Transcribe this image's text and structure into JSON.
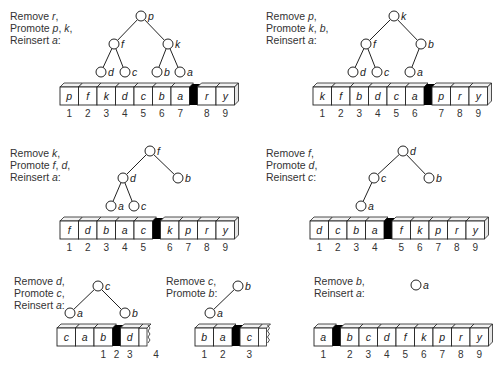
{
  "panels": [
    {
      "id": "step1",
      "caption": [
        [
          "Remove ",
          "r",
          ","
        ],
        [
          "Promote ",
          "p",
          ", ",
          "k",
          ","
        ],
        [
          "Reinsert ",
          "a",
          ":"
        ]
      ],
      "caption_pos": [
        10,
        20
      ],
      "tree": {
        "nodes": [
          {
            "label": "p",
            "x": 141,
            "y": 16
          },
          {
            "label": "f",
            "x": 114,
            "y": 44
          },
          {
            "label": "k",
            "x": 168,
            "y": 44
          },
          {
            "label": "d",
            "x": 101,
            "y": 72
          },
          {
            "label": "c",
            "x": 125,
            "y": 72
          },
          {
            "label": "b",
            "x": 157,
            "y": 72
          },
          {
            "label": "a",
            "x": 180,
            "y": 72
          }
        ],
        "edges": [
          [
            0,
            1
          ],
          [
            0,
            2
          ],
          [
            1,
            3
          ],
          [
            1,
            4
          ],
          [
            2,
            5
          ],
          [
            2,
            6
          ]
        ]
      },
      "array": {
        "x": 60,
        "y": 87,
        "cells": [
          "p",
          "f",
          "k",
          "d",
          "c",
          "b",
          "a",
          "|",
          "r",
          "y"
        ],
        "indices": [
          "1",
          "2",
          "3",
          "4",
          "5",
          "6",
          "7",
          "",
          "8",
          "9"
        ],
        "torn": false
      }
    },
    {
      "id": "step2",
      "caption": [
        [
          "Remove ",
          "p",
          ","
        ],
        [
          "Promote ",
          "k",
          ", ",
          "b",
          ","
        ],
        [
          "Reinsert ",
          "a",
          ":"
        ]
      ],
      "caption_pos": [
        266,
        20
      ],
      "tree": {
        "nodes": [
          {
            "label": "k",
            "x": 394,
            "y": 16
          },
          {
            "label": "f",
            "x": 366,
            "y": 44
          },
          {
            "label": "b",
            "x": 421,
            "y": 44
          },
          {
            "label": "d",
            "x": 353,
            "y": 72
          },
          {
            "label": "c",
            "x": 377,
            "y": 72
          },
          {
            "label": "a",
            "x": 410,
            "y": 72
          }
        ],
        "edges": [
          [
            0,
            1
          ],
          [
            0,
            2
          ],
          [
            1,
            3
          ],
          [
            1,
            4
          ],
          [
            2,
            5
          ]
        ]
      },
      "array": {
        "x": 313,
        "y": 87,
        "cells": [
          "k",
          "f",
          "b",
          "d",
          "c",
          "a",
          "|",
          "p",
          "r",
          "y"
        ],
        "indices": [
          "1",
          "2",
          "3",
          "4",
          "5",
          "6",
          "",
          "7",
          "8",
          "9"
        ],
        "torn": false
      }
    },
    {
      "id": "step3",
      "caption": [
        [
          "Remove ",
          "k",
          ","
        ],
        [
          "Promote ",
          "f",
          ", ",
          "d",
          ","
        ],
        [
          "Reinsert ",
          "a",
          ":"
        ]
      ],
      "caption_pos": [
        10,
        157
      ],
      "tree": {
        "nodes": [
          {
            "label": "f",
            "x": 150,
            "y": 151
          },
          {
            "label": "d",
            "x": 123,
            "y": 178
          },
          {
            "label": "b",
            "x": 178,
            "y": 178
          },
          {
            "label": "a",
            "x": 111,
            "y": 206
          },
          {
            "label": "c",
            "x": 134,
            "y": 206
          }
        ],
        "edges": [
          [
            0,
            1
          ],
          [
            0,
            2
          ],
          [
            1,
            3
          ],
          [
            1,
            4
          ]
        ]
      },
      "array": {
        "x": 60,
        "y": 221,
        "cells": [
          "f",
          "d",
          "b",
          "a",
          "c",
          "|",
          "k",
          "p",
          "r",
          "y"
        ],
        "indices": [
          "1",
          "2",
          "3",
          "4",
          "5",
          "",
          "6",
          "7",
          "8",
          "9"
        ],
        "torn": false
      }
    },
    {
      "id": "step4",
      "caption": [
        [
          "Remove ",
          "f",
          ","
        ],
        [
          "Promote ",
          "d",
          ","
        ],
        [
          "Reinsert ",
          "c",
          ":"
        ]
      ],
      "caption_pos": [
        266,
        157
      ],
      "tree": {
        "nodes": [
          {
            "label": "d",
            "x": 403,
            "y": 151
          },
          {
            "label": "c",
            "x": 374,
            "y": 178
          },
          {
            "label": "b",
            "x": 429,
            "y": 178
          },
          {
            "label": "a",
            "x": 361,
            "y": 206
          }
        ],
        "edges": [
          [
            0,
            1
          ],
          [
            0,
            2
          ],
          [
            1,
            3
          ]
        ]
      },
      "array": {
        "x": 310,
        "y": 221,
        "cells": [
          "d",
          "c",
          "b",
          "a",
          "|",
          "f",
          "k",
          "p",
          "r",
          "y"
        ],
        "indices": [
          "1",
          "2",
          "3",
          "4",
          "",
          "5",
          "6",
          "7",
          "8",
          "9"
        ],
        "torn": false
      }
    },
    {
      "id": "step5",
      "caption": [
        [
          "Remove ",
          "d",
          ","
        ],
        [
          "Promote ",
          "c",
          ","
        ],
        [
          "Reinsert ",
          "a",
          ":"
        ]
      ],
      "caption_pos": [
        14,
        285
      ],
      "tree": {
        "nodes": [
          {
            "label": "c",
            "x": 98,
            "y": 286
          },
          {
            "label": "a",
            "x": 70,
            "y": 313
          },
          {
            "label": "b",
            "x": 125,
            "y": 313
          }
        ],
        "edges": [
          [
            0,
            1
          ],
          [
            0,
            2
          ]
        ]
      },
      "array": {
        "x": 57,
        "y": 328,
        "cells": [
          "c",
          "a",
          "b",
          "|",
          "d"
        ],
        "indices": [
          "",
          "",
          "1",
          "2",
          "3"
        ],
        "extra_index": {
          "label": "4",
          "x": 156
        },
        "torn": true
      }
    },
    {
      "id": "step6",
      "caption": [
        [
          "Remove ",
          "c",
          ","
        ],
        [
          "Promote ",
          "b",
          ":"
        ]
      ],
      "caption_pos": [
        166,
        285
      ],
      "tree": {
        "nodes": [
          {
            "label": "b",
            "x": 238,
            "y": 286
          },
          {
            "label": "a",
            "x": 210,
            "y": 313
          }
        ],
        "edges": [
          [
            0,
            1
          ]
        ]
      },
      "array": {
        "x": 195,
        "y": 328,
        "cells": [
          "b",
          "a",
          "|",
          "c"
        ],
        "indices": [
          "1",
          "2",
          "",
          "3"
        ],
        "torn": true
      }
    },
    {
      "id": "step7",
      "caption": [
        [
          "Remove ",
          "b",
          ","
        ],
        [
          "Reinsert ",
          "a",
          ":"
        ]
      ],
      "caption_pos": [
        314,
        285
      ],
      "tree": {
        "nodes": [
          {
            "label": "a",
            "x": 416,
            "y": 285
          }
        ],
        "edges": []
      },
      "array": {
        "x": 314,
        "y": 328,
        "cells": [
          "a",
          "|",
          "b",
          "c",
          "d",
          "f",
          "k",
          "p",
          "r",
          "y"
        ],
        "indices": [
          "1",
          "",
          "2",
          "3",
          "4",
          "5",
          "6",
          "7",
          "8",
          "9"
        ],
        "torn": false
      }
    }
  ],
  "style": {
    "stroke": "#222222",
    "divider": "#000000",
    "face": "#ffffff",
    "top": "#f2f2f2",
    "side": "#e6e6e6"
  }
}
